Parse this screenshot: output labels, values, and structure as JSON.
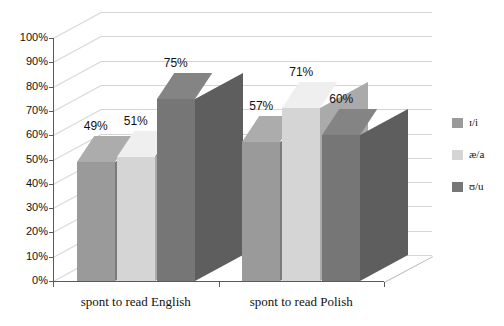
{
  "chart_data": {
    "type": "bar",
    "title": "",
    "xlabel": "",
    "ylabel": "",
    "categories": [
      "spont to read English",
      "spont to read Polish"
    ],
    "series": [
      {
        "name": "ɪ/i",
        "color": "#9a9a9a",
        "values": [
          49,
          51
        ]
      },
      {
        "name": "æ/a",
        "color": "#d5d5d5",
        "values": [
          51,
          71
        ]
      },
      {
        "name": "ʊ/u",
        "color": "#767676",
        "values": [
          75,
          60
        ]
      }
    ],
    "series_display": [
      {
        "name": "ɪ/i",
        "color": "#9a9a9a"
      },
      {
        "name": "æ/a",
        "color": "#d5d5d5"
      },
      {
        "name": "ʊ/u",
        "color": "#767676"
      }
    ],
    "bars": [
      {
        "group": 0,
        "series": 0,
        "value": 49,
        "label": "49%",
        "color": "#9a9a9a"
      },
      {
        "group": 0,
        "series": 1,
        "value": 51,
        "label": "51%",
        "color": "#d5d5d5"
      },
      {
        "group": 0,
        "series": 2,
        "value": 75,
        "label": "75%",
        "color": "#767676"
      },
      {
        "group": 1,
        "series": 0,
        "value": 57,
        "label": "57%",
        "color": "#9a9a9a"
      },
      {
        "group": 1,
        "series": 1,
        "value": 71,
        "label": "71%",
        "color": "#d5d5d5"
      },
      {
        "group": 1,
        "series": 2,
        "value": 60,
        "label": "60%",
        "color": "#767676"
      }
    ],
    "ylim": [
      0,
      100
    ],
    "ytick_step": 10,
    "yticks": [
      "0%",
      "10%",
      "20%",
      "30%",
      "40%",
      "50%",
      "60%",
      "70%",
      "80%",
      "90%",
      "100%"
    ],
    "grid": true,
    "legend_position": "right",
    "three_d": true
  },
  "colors": {
    "grid": "#d6d6d6",
    "axis": "#5a5a5a",
    "background": "#ffffff",
    "text": "#111111"
  }
}
